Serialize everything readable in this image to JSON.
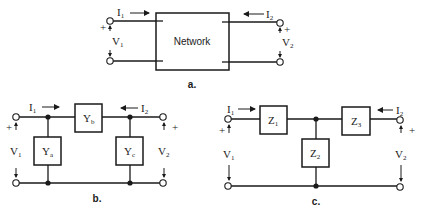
{
  "diagrams": {
    "a": {
      "caption": "a.",
      "box_label": "Network",
      "i1": "I",
      "i1_sub": "1",
      "i2": "I",
      "i2_sub": "2",
      "v1": "V",
      "v1_sub": "1",
      "v2": "V",
      "v2_sub": "2",
      "plus": "+"
    },
    "b": {
      "caption": "b.",
      "ya": "Y",
      "ya_sub": "a",
      "yb": "Y",
      "yb_sub": "b",
      "yc": "Y",
      "yc_sub": "c",
      "i1": "I",
      "i1_sub": "1",
      "i2": "I",
      "i2_sub": "2",
      "v1": "V",
      "v1_sub": "1",
      "v2": "V",
      "v2_sub": "2",
      "plus": "+"
    },
    "c": {
      "caption": "c.",
      "z1": "Z",
      "z1_sub": "1",
      "z2": "Z",
      "z2_sub": "2",
      "z3": "Z",
      "z3_sub": "3",
      "i1": "I",
      "i1_sub": "1",
      "i2": "I",
      "i2_sub": "2",
      "v1": "V",
      "v1_sub": "1",
      "v2": "V",
      "v2_sub": "2",
      "plus": "+"
    }
  },
  "colors": {
    "ink": "#1a1a1a",
    "background": "#ffffff"
  }
}
